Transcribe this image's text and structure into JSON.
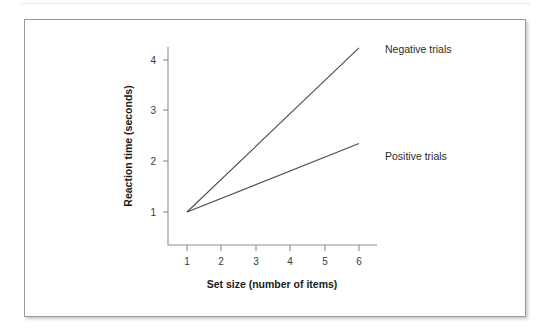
{
  "figure": {
    "background_color": "#ffffff",
    "frame_color": "#9a9a9a"
  },
  "chart_data": {
    "type": "line",
    "title": "",
    "subtitle": "",
    "xlabel": "Set size (number of items)",
    "ylabel": "Reaction time (seconds)",
    "x": [
      1,
      6
    ],
    "xlim": [
      0.6,
      6.5
    ],
    "ylim": [
      0.3,
      4.45
    ],
    "xticks": [
      1,
      2,
      3,
      4,
      5,
      6
    ],
    "xtick_labels": [
      "1",
      "2",
      "3",
      "4",
      "5",
      "6"
    ],
    "yticks": [
      1,
      2,
      3,
      4
    ],
    "ytick_labels": [
      "1",
      "2",
      "3",
      "4"
    ],
    "grid": false,
    "legend_position": "inline-end-of-line",
    "line_color": "#4a4a4a",
    "series": [
      {
        "name": "Negative trials",
        "x": [
          1,
          6
        ],
        "values": [
          1.0,
          4.24
        ],
        "slope_per_item": 0.648,
        "intercept": 0.352,
        "label_x": 6.15,
        "label_y": 4.0
      },
      {
        "name": "Positive trials",
        "x": [
          1,
          6
        ],
        "values": [
          1.0,
          2.35
        ],
        "slope_per_item": 0.27,
        "intercept": 0.73,
        "label_x": 6.15,
        "label_y": 2.2
      }
    ]
  }
}
